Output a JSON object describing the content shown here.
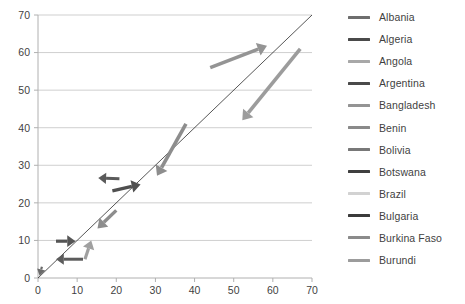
{
  "chart_data": {
    "type": "scatter",
    "title": "",
    "xlabel": "",
    "ylabel": "",
    "xlim": [
      0,
      70
    ],
    "ylim": [
      0,
      70
    ],
    "xticks": [
      0,
      10,
      20,
      30,
      40,
      50,
      60,
      70
    ],
    "yticks": [
      0,
      10,
      20,
      30,
      40,
      50,
      60,
      70
    ],
    "grid": "horizontal",
    "legend_position": "right",
    "reference_line": {
      "name": "identity-line",
      "from": [
        0,
        0
      ],
      "to": [
        70,
        70
      ],
      "color": "#2b2b2b",
      "width": 0.8
    },
    "series": [
      {
        "name": "Albania",
        "color": "#808080",
        "swatch_color": "#6e6e6e",
        "arrow": null
      },
      {
        "name": "Algeria",
        "color": "#5a5a5a",
        "swatch_color": "#4a4a4a",
        "arrow": {
          "from": [
            1.0,
            3.0
          ],
          "to": [
            0.4,
            0.6
          ],
          "width": 2.2,
          "color": "#6a6a6a"
        }
      },
      {
        "name": "Angola",
        "color": "#a8a8a8",
        "swatch_color": "#a8a8a8",
        "arrow": {
          "from": [
            12.0,
            5.0
          ],
          "to": [
            13.6,
            10.0
          ],
          "width": 3.2,
          "color": "#a0a0a0"
        }
      },
      {
        "name": "Argentina",
        "color": "#4f4f4f",
        "swatch_color": "#4a4a4a",
        "arrow": {
          "from": [
            11.5,
            5.0
          ],
          "to": [
            4.6,
            5.0
          ],
          "width": 3.0,
          "color": "#5c5c5c"
        }
      },
      {
        "name": "Bangladesh",
        "color": "#989898",
        "swatch_color": "#949494",
        "arrow": {
          "from": [
            44.0,
            56.0
          ],
          "to": [
            58.5,
            61.8
          ],
          "width": 3.6,
          "color": "#949494"
        }
      },
      {
        "name": "Benin",
        "color": "#8d8d8d",
        "swatch_color": "#8a8a8a",
        "arrow": {
          "from": [
            20.0,
            18.0
          ],
          "to": [
            15.2,
            13.2
          ],
          "width": 3.4,
          "color": "#8d8d8d"
        }
      },
      {
        "name": "Bolivia",
        "color": "#8d8d8d",
        "swatch_color": "#787878",
        "arrow": {
          "from": [
            37.8,
            41.0
          ],
          "to": [
            30.4,
            27.2
          ],
          "width": 3.6,
          "color": "#8d8d8d"
        }
      },
      {
        "name": "Botswana",
        "color": "#4a4a4a",
        "swatch_color": "#3f3f3f",
        "arrow": {
          "from": [
            19.0,
            23.2
          ],
          "to": [
            26.2,
            24.9
          ],
          "width": 3.4,
          "color": "#4f4f4f"
        }
      },
      {
        "name": "Brazil",
        "color": "#d2d2d2",
        "swatch_color": "#d2d2d2",
        "arrow": null
      },
      {
        "name": "Bulgaria",
        "color": "#434343",
        "swatch_color": "#3b3b3b",
        "arrow": {
          "from": [
            4.6,
            9.8
          ],
          "to": [
            9.6,
            9.8
          ],
          "width": 3.2,
          "color": "#555555"
        }
      },
      {
        "name": "Burkina Faso",
        "color": "#8b8b8b",
        "swatch_color": "#8b8b8b",
        "arrow": {
          "from": [
            20.8,
            26.4
          ],
          "to": [
            15.4,
            26.6
          ],
          "width": 3.0,
          "color": "#5a5a5a"
        }
      },
      {
        "name": "Burundi",
        "color": "#9c9c9c",
        "swatch_color": "#9c9c9c",
        "arrow": {
          "from": [
            67.0,
            61.0
          ],
          "to": [
            52.2,
            42.0
          ],
          "width": 3.6,
          "color": "#9c9c9c"
        }
      }
    ]
  },
  "axes": {
    "x_tick_labels": [
      "0",
      "10",
      "20",
      "30",
      "40",
      "50",
      "60",
      "70"
    ],
    "y_tick_labels": [
      "0",
      "10",
      "20",
      "30",
      "40",
      "50",
      "60",
      "70"
    ]
  },
  "legend": {
    "items": [
      {
        "label": "Albania",
        "color": "#6e6e6e"
      },
      {
        "label": "Algeria",
        "color": "#4a4a4a"
      },
      {
        "label": "Angola",
        "color": "#a8a8a8"
      },
      {
        "label": "Argentina",
        "color": "#4a4a4a"
      },
      {
        "label": "Bangladesh",
        "color": "#949494"
      },
      {
        "label": "Benin",
        "color": "#8a8a8a"
      },
      {
        "label": "Bolivia",
        "color": "#787878"
      },
      {
        "label": "Botswana",
        "color": "#3f3f3f"
      },
      {
        "label": "Brazil",
        "color": "#d2d2d2"
      },
      {
        "label": "Bulgaria",
        "color": "#3b3b3b"
      },
      {
        "label": "Burkina Faso",
        "color": "#8b8b8b"
      },
      {
        "label": "Burundi",
        "color": "#9c9c9c"
      }
    ]
  },
  "colors": {
    "gridline": "#c9c9c9",
    "axis": "#b0b0b0",
    "tick_text": "#3f3f3f",
    "background": "#ffffff"
  }
}
